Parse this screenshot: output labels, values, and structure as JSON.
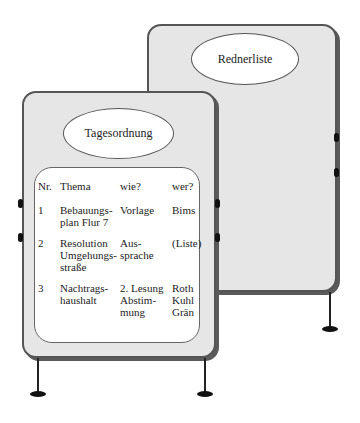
{
  "back_board": {
    "title": "Rednerliste"
  },
  "front_board": {
    "title": "Tagesordnung",
    "table": {
      "headers": [
        "Nr.",
        "Thema",
        "wie?",
        "wer?"
      ],
      "rows": [
        {
          "nr": "1",
          "thema": [
            "Bebauungs-",
            "plan Flur 7"
          ],
          "wie": [
            "Vorlage"
          ],
          "wer": [
            "Bims"
          ]
        },
        {
          "nr": "2",
          "thema": [
            "Resolution",
            "Umgehungs-",
            "straße"
          ],
          "wie": [
            "Aus-",
            "sprache"
          ],
          "wer": [
            "(Liste)"
          ]
        },
        {
          "nr": "3",
          "thema": [
            "Nachtrags-",
            "haushalt"
          ],
          "wie": [
            "2. Lesung",
            "Abstim-",
            "mung"
          ],
          "wer": [
            "Roth",
            "Kuhl",
            "Grän"
          ]
        }
      ]
    }
  },
  "colors": {
    "board_fill": "#e6e6e6",
    "board_border": "#555555",
    "panel_fill": "#ffffff"
  }
}
